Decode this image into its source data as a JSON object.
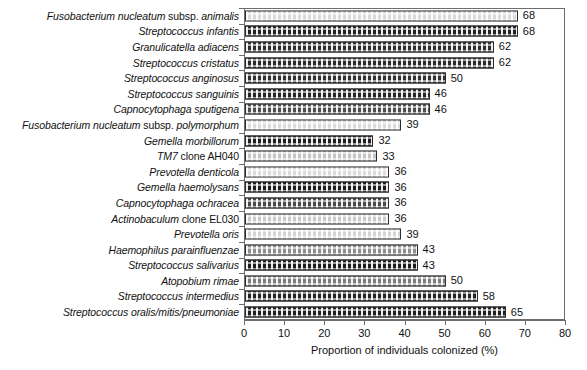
{
  "chart_data": {
    "type": "bar",
    "orientation": "horizontal",
    "title": "",
    "xlabel": "Proportion of individuals colonized (%)",
    "ylabel": "",
    "xlim": [
      0,
      80
    ],
    "xticks": [
      0,
      10,
      20,
      30,
      40,
      50,
      60,
      70,
      80
    ],
    "grid": false,
    "legend": "none",
    "categories": [
      "Fusobacterium nucleatum subsp. animalis",
      "Streptococcus infantis",
      "Granulicatella adiacens",
      "Streptococcus cristatus",
      "Streptococcus anginosus",
      "Streptococcus sanguinis",
      "Capnocytophaga sputigena",
      "Fusobacterium nucleatum subsp. polymorphum",
      "Gemella morbillorum",
      "TM7 clone AH040",
      "Prevotella denticola",
      "Gemella haemolysans",
      "Capnocytophaga ochracea",
      "Actinobaculum clone EL030",
      "Prevotella oris",
      "Haemophilus parainfluenzae",
      "Streptococcus salivarius",
      "Atopobium rimae",
      "Streptococcus intermedius",
      "Streptococcus oralis/mitis/pneumoniae"
    ],
    "values": [
      68,
      68,
      62,
      62,
      50,
      46,
      46,
      39,
      32,
      33,
      36,
      36,
      36,
      36,
      39,
      43,
      43,
      50,
      58,
      65
    ]
  },
  "rows": [
    {
      "label_italic": "Fusobacterium nucleatum",
      "label_roman": " subsp. ",
      "label_italic2": "animalis",
      "value": 68,
      "value_text": "68",
      "fill": "#d9d9d9"
    },
    {
      "label_italic": "Streptococcus infantis",
      "label_roman": "",
      "label_italic2": "",
      "value": 68,
      "value_text": "68",
      "fill": "#222222"
    },
    {
      "label_italic": "Granulicatella adiacens",
      "label_roman": "",
      "label_italic2": "",
      "value": 62,
      "value_text": "62",
      "fill": "#2e2e2e"
    },
    {
      "label_italic": "Streptococcus cristatus",
      "label_roman": "",
      "label_italic2": "",
      "value": 62,
      "value_text": "62",
      "fill": "#2b2b2b"
    },
    {
      "label_italic": "Streptococcus anginosus",
      "label_roman": "",
      "label_italic2": "",
      "value": 50,
      "value_text": "50",
      "fill": "#303030"
    },
    {
      "label_italic": "Streptococcus sanguinis",
      "label_roman": "",
      "label_italic2": "",
      "value": 46,
      "value_text": "46",
      "fill": "#262626"
    },
    {
      "label_italic": "Capnocytophaga sputigena",
      "label_roman": "",
      "label_italic2": "",
      "value": 46,
      "value_text": "46",
      "fill": "#4e4e4e"
    },
    {
      "label_italic": "Fusobacterium nucleatum",
      "label_roman": " subsp. ",
      "label_italic2": "polymorphum",
      "value": 39,
      "value_text": "39",
      "fill": "#dcdcdc"
    },
    {
      "label_italic": "Gemella morbillorum",
      "label_roman": "",
      "label_italic2": "",
      "value": 32,
      "value_text": "32",
      "fill": "#1f1f1f"
    },
    {
      "label_italic": "TM7",
      "label_roman": " clone AH040",
      "label_italic2": "",
      "value": 33,
      "value_text": "33",
      "fill": "#c4c4c4"
    },
    {
      "label_italic": "Prevotella denticola",
      "label_roman": "",
      "label_italic2": "",
      "value": 36,
      "value_text": "36",
      "fill": "#dcdcdc"
    },
    {
      "label_italic": "Gemella haemolysans",
      "label_roman": "",
      "label_italic2": "",
      "value": 36,
      "value_text": "36",
      "fill": "#1d1d1d"
    },
    {
      "label_italic": "Capnocytophaga ochracea",
      "label_roman": "",
      "label_italic2": "",
      "value": 36,
      "value_text": "36",
      "fill": "#4a4a4a"
    },
    {
      "label_italic": "Actinobaculum",
      "label_roman": " clone EL030",
      "label_italic2": "",
      "value": 36,
      "value_text": "36",
      "fill": "#c9c9c9"
    },
    {
      "label_italic": "Prevotella oris",
      "label_roman": "",
      "label_italic2": "",
      "value": 39,
      "value_text": "39",
      "fill": "#d4d4d4"
    },
    {
      "label_italic": "Haemophilus parainfluenzae",
      "label_roman": "",
      "label_italic2": "",
      "value": 43,
      "value_text": "43",
      "fill": "#8f8f8f"
    },
    {
      "label_italic": "Streptococcus salivarius",
      "label_roman": "",
      "label_italic2": "",
      "value": 43,
      "value_text": "43",
      "fill": "#1c1c1c"
    },
    {
      "label_italic": "Atopobium rimae",
      "label_roman": "",
      "label_italic2": "",
      "value": 50,
      "value_text": "50",
      "fill": "#7d7d7d"
    },
    {
      "label_italic": "Streptococcus intermedius",
      "label_roman": "",
      "label_italic2": "",
      "value": 58,
      "value_text": "58",
      "fill": "#232323"
    },
    {
      "label_italic": "Streptococcus oralis/mitis/pneumoniae",
      "label_roman": "",
      "label_italic2": "",
      "value": 65,
      "value_text": "65",
      "fill": "#202020"
    }
  ],
  "axis": {
    "title": "Proportion of individuals colonized (%)",
    "ticks": [
      "0",
      "10",
      "20",
      "30",
      "40",
      "50",
      "60",
      "70",
      "80"
    ]
  }
}
